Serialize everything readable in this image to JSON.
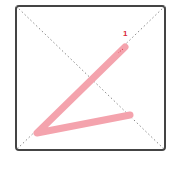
{
  "diagram": {
    "type": "stroke-order",
    "frame": {
      "x": 16,
      "y": 6,
      "width": 149,
      "height": 144,
      "border_color": "#444444",
      "radius": 3
    },
    "guides": {
      "color": "#888888",
      "style": "dotted"
    },
    "strokes": [
      {
        "number": "1",
        "color": "#f4a3ad",
        "points": [
          [
            125,
            47
          ],
          [
            37,
            133
          ],
          [
            130,
            115
          ]
        ],
        "label_pos": {
          "x": 123,
          "y": 30
        }
      }
    ],
    "label_color": "#d9263c"
  }
}
